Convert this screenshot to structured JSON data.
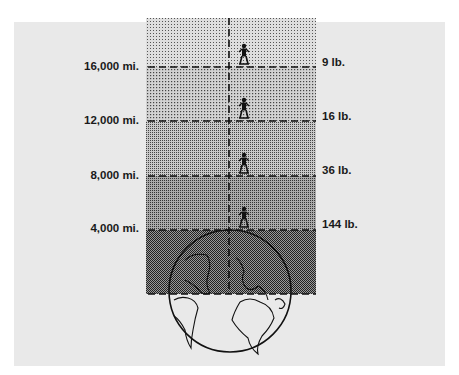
{
  "diagram": {
    "title": "",
    "levels": [
      {
        "distance": "16,000 mi.",
        "weight": "9 lb."
      },
      {
        "distance": "12,000 mi.",
        "weight": "16 lb."
      },
      {
        "distance": "8,000 mi.",
        "weight": "36 lb."
      },
      {
        "distance": "4,000 mi.",
        "weight": "144 lb."
      }
    ],
    "icons": [
      "person-figure",
      "earth-globe"
    ],
    "colors": {
      "panel": "#e9e9e9",
      "ink": "#1a1a1a"
    }
  }
}
